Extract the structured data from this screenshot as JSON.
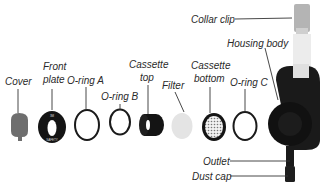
{
  "diagram": {
    "type": "exploded-view",
    "labels": {
      "cover": "Cover",
      "front_plate_1": "Front",
      "front_plate_2": "plate",
      "o_ring_a": "O-ring A",
      "o_ring_b": "O-ring B",
      "cassette_top_1": "Cassette",
      "cassette_top_2": "top",
      "filter": "Filter",
      "cassette_bottom_1": "Cassette",
      "cassette_bottom_2": "bottom",
      "o_ring_c": "O-ring C",
      "housing_body": "Housing body",
      "collar_clip": "Collar clip",
      "outlet": "Outlet",
      "dust_cap": "Dust cap"
    },
    "colors": {
      "part_black": "#141414",
      "cover_gray": "#6e6e6e",
      "filter_gray": "#e4e4e4",
      "clip_gray": "#b0b0b0",
      "label_text": "#2a2a2a"
    }
  }
}
